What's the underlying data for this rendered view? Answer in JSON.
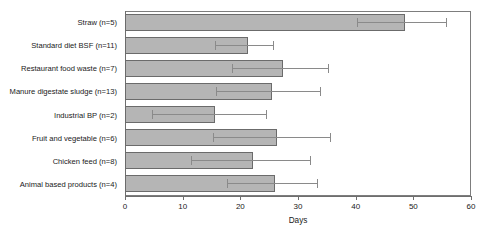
{
  "chart_data": {
    "type": "bar",
    "orientation": "horizontal",
    "title": "",
    "xlabel": "Days",
    "ylabel": "",
    "xlim": [
      0,
      60
    ],
    "xticks": [
      0,
      10,
      20,
      30,
      40,
      50,
      60
    ],
    "grid": false,
    "legend": null,
    "error_bars": "asymmetric whiskers (low, high)",
    "categories": [
      "Straw (n=5)",
      "Standard diet BSF (n=11)",
      "Restaurant food waste (n=7)",
      "Manure digestate sludge (n=13)",
      "Industrial BP (n=2)",
      "Fruit and vegetable (n=6)",
      "Chicken feed (n=8)",
      "Animal based products (n=4)"
    ],
    "values": [
      48.5,
      21.3,
      27.4,
      25.5,
      15.6,
      26.3,
      22.2,
      26.0
    ],
    "err_low": [
      40.2,
      15.6,
      18.5,
      15.8,
      4.7,
      15.3,
      11.4,
      17.7
    ],
    "err_high": [
      55.6,
      25.6,
      35.2,
      33.8,
      24.4,
      35.5,
      32.1,
      33.3
    ],
    "bar_fill_color": "#b5b5b5",
    "bar_edge_color": "#6b6b6b",
    "error_bar_color": "#8a8a8a",
    "axis_color": "#6e6e6e"
  }
}
